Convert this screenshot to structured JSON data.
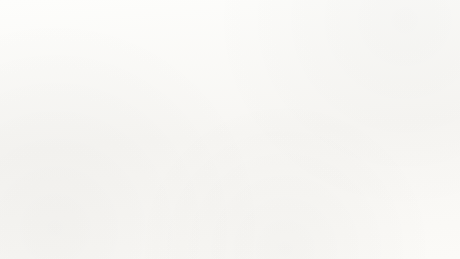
{
  "figure": {
    "background_color": "#fbfaf8",
    "ink_color": "#17161a"
  },
  "chart_data": {
    "type": "pie",
    "title": "",
    "subtitle": "",
    "xlabel": "",
    "ylabel": "",
    "grid": false,
    "legend_position": "right",
    "units": "percent",
    "exploded_slice": "Protestant",
    "categories": [
      "Catholic",
      "Mormon",
      "Other Religion",
      "Refused",
      "No Religion",
      "Protestant"
    ],
    "values": [
      59,
      0.2,
      4.8,
      8.3,
      10.1,
      17.4
    ],
    "slice_labels": [
      "Catholic 59%",
      "Mormon 0.2%",
      "Other Religion 4.8%",
      "Refused 8.3%",
      "No Religion 10.1%",
      "Protestant 17.4%"
    ],
    "slice_colors": [
      "#e4e2dd",
      "#f2f1ee",
      "#a8a6a3",
      "#8a8885",
      "#565459",
      "#3a383e"
    ],
    "breakout": {
      "type": "bar",
      "orientation": "vertical-stacked",
      "parent_category": "Protestant",
      "parent_value": 17.4,
      "parent_label": "Protestant",
      "parent_value_label": "17.4%",
      "categories": [
        "Other Protestant",
        "Churches of Christ",
        "Christian Church",
        "Pentecostal",
        "Episcopalian",
        "Presbyterian",
        "Lutheran",
        "Methodist",
        "Baptist"
      ],
      "values": [
        1.9,
        1.4,
        4.8,
        2.9,
        0.4,
        0.4,
        0.6,
        0.9,
        3.6
      ],
      "labels": [
        "Other Protestant 1.9%",
        "Churches of Christ 1.4%",
        "Christian Church 4.8%",
        "Pentecostal 2.9%",
        "Episcopalian 0.4%",
        "Presbyterian 0.4%",
        "Lutheran 0.6%",
        "Methodist 0.9%",
        "Baptist 3.6%"
      ],
      "segment_colors": [
        "#dedcd7",
        "#322f36",
        "#c9c7c2",
        "#cfcdc8",
        "#2d2a31",
        "#34313a",
        "#b9b7b2",
        "#3a373f",
        "#49464e"
      ]
    }
  },
  "callout_labels": {
    "mormon": "Mormon 0.2%",
    "other_religion": "Other Religion 4.8%",
    "refused": "Refused 8.3%",
    "no_religion": "No Religion 10.1%",
    "catholic": "Catholic 59%",
    "protestant_name": "Protestant",
    "protestant_value": "17.4%"
  }
}
